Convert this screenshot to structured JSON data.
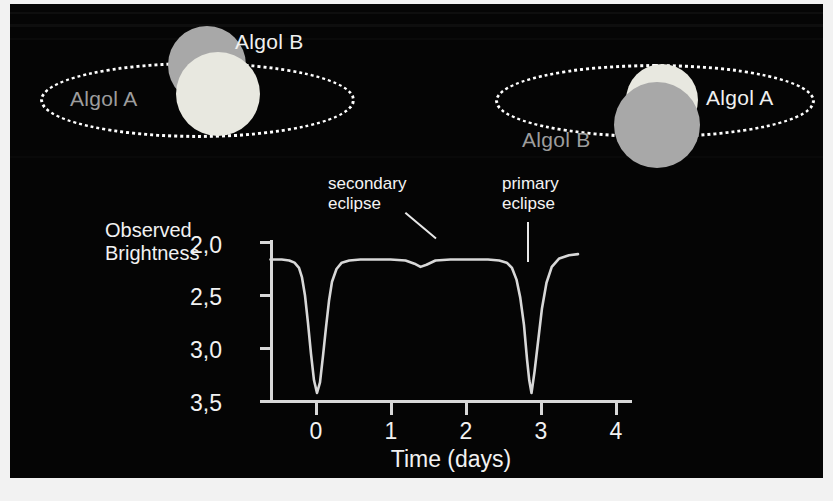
{
  "figure": {
    "background": "#050505",
    "accent": "#d8d8d8",
    "star_a_color": "#e8e8e0",
    "star_b_color": "#a8a8a8"
  },
  "diagrams": [
    {
      "id": "secondary-configuration",
      "labels": [
        {
          "name": "star-a-label",
          "text": "Algol A",
          "tone": "bright"
        },
        {
          "name": "star-b-label",
          "text": "Algol B",
          "tone": "bright"
        }
      ]
    },
    {
      "id": "primary-configuration",
      "labels": [
        {
          "name": "star-a-label",
          "text": "Algol A",
          "tone": "bright"
        },
        {
          "name": "star-b-label",
          "text": "Algol B",
          "tone": "dim"
        }
      ]
    }
  ],
  "annotations": [
    {
      "name": "secondary-eclipse-annotation",
      "line1": "secondary",
      "line2": "eclipse"
    },
    {
      "name": "primary-eclipse-annotation",
      "line1": "primary",
      "line2": "eclipse"
    }
  ],
  "chart_data": {
    "type": "line",
    "title": "",
    "xlabel": "Time (days)",
    "ylabel_line1": "Observed",
    "ylabel_line2": "Brightness",
    "xlim": [
      -0.7,
      4.4
    ],
    "ylim": [
      2.0,
      3.6
    ],
    "y_inverted": true,
    "grid": false,
    "legend": "none",
    "xticks": [
      0,
      1,
      2,
      3,
      4
    ],
    "xticklabels": [
      "0",
      "1",
      "2",
      "3",
      "4"
    ],
    "yticks": [
      2.0,
      2.5,
      3.0,
      3.5
    ],
    "yticklabels": [
      "2,0",
      "2,5",
      "3,0",
      "3,5"
    ],
    "baseline_magnitude": 2.15,
    "primary_minimum": {
      "x": 2.85,
      "y": 3.42
    },
    "secondary_minimum": {
      "x": 1.4,
      "y": 2.23
    },
    "series": [
      {
        "name": "Algol light curve",
        "color": "#d8d8d8",
        "x": [
          -0.6,
          -0.45,
          -0.35,
          -0.28,
          -0.22,
          -0.18,
          -0.14,
          -0.1,
          -0.06,
          -0.02,
          0.02,
          0.06,
          0.1,
          0.14,
          0.18,
          0.22,
          0.28,
          0.35,
          0.45,
          0.6,
          0.8,
          1.0,
          1.2,
          1.32,
          1.4,
          1.48,
          1.6,
          1.8,
          2.05,
          2.3,
          2.45,
          2.55,
          2.62,
          2.68,
          2.73,
          2.78,
          2.82,
          2.85,
          2.88,
          2.92,
          2.97,
          3.02,
          3.08,
          3.15,
          3.25,
          3.38,
          3.5
        ],
        "y": [
          2.16,
          2.16,
          2.17,
          2.19,
          2.24,
          2.33,
          2.5,
          2.76,
          3.05,
          3.3,
          3.42,
          3.32,
          3.07,
          2.8,
          2.55,
          2.37,
          2.25,
          2.19,
          2.17,
          2.16,
          2.16,
          2.16,
          2.17,
          2.2,
          2.23,
          2.21,
          2.17,
          2.16,
          2.16,
          2.16,
          2.17,
          2.19,
          2.24,
          2.35,
          2.52,
          2.78,
          3.1,
          3.3,
          3.42,
          3.22,
          2.92,
          2.62,
          2.38,
          2.23,
          2.15,
          2.12,
          2.11
        ]
      }
    ]
  }
}
